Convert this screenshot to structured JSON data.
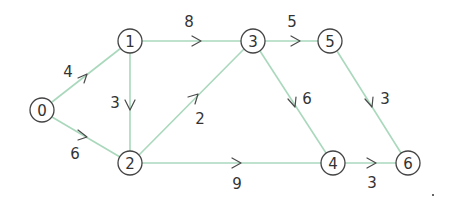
{
  "graph": {
    "title": "",
    "colors": {
      "edge": "#a9d8bc",
      "node_stroke": "#444444",
      "text": "#333333",
      "arrow": "#4a4a4a"
    },
    "nodes": [
      {
        "id": "0",
        "label": "0",
        "x": 42,
        "y": 110
      },
      {
        "id": "1",
        "label": "1",
        "x": 130,
        "y": 41
      },
      {
        "id": "2",
        "label": "2",
        "x": 130,
        "y": 163
      },
      {
        "id": "3",
        "label": "3",
        "x": 253,
        "y": 41
      },
      {
        "id": "4",
        "label": "4",
        "x": 333,
        "y": 163
      },
      {
        "id": "5",
        "label": "5",
        "x": 330,
        "y": 41
      },
      {
        "id": "6",
        "label": "6",
        "x": 408,
        "y": 163
      }
    ],
    "edges": [
      {
        "from": "0",
        "to": "1",
        "weight": "4"
      },
      {
        "from": "0",
        "to": "2",
        "weight": "6"
      },
      {
        "from": "1",
        "to": "2",
        "weight": "3"
      },
      {
        "from": "1",
        "to": "3",
        "weight": "8"
      },
      {
        "from": "2",
        "to": "3",
        "weight": "2"
      },
      {
        "from": "2",
        "to": "4",
        "weight": "9"
      },
      {
        "from": "3",
        "to": "5",
        "weight": "5"
      },
      {
        "from": "3",
        "to": "4",
        "weight": "6"
      },
      {
        "from": "5",
        "to": "6",
        "weight": "3"
      },
      {
        "from": "4",
        "to": "6",
        "weight": "3"
      }
    ]
  }
}
